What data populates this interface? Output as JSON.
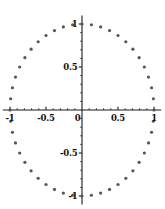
{
  "chart_data": {
    "type": "scatter",
    "title": "",
    "subtitle": "",
    "xlabel": "",
    "ylabel": "",
    "xlim": [
      -1.1,
      1.1
    ],
    "ylim": [
      -1.1,
      1.1
    ],
    "grid": false,
    "legend": null,
    "axes_style": "crossed-at-origin",
    "point_color": "#555555",
    "axis_color": "#1a1a1a",
    "point_size_px": 1.6,
    "n_points": 48,
    "radius": 1.0,
    "x_ticks": [
      -1,
      -0.5,
      0,
      0.5,
      1
    ],
    "x_tick_labels": [
      "-1",
      "-0.5",
      "0",
      "0.5",
      "1"
    ],
    "y_ticks": [
      -1,
      -0.5,
      0.5,
      1
    ],
    "y_tick_labels": [
      "-1",
      "-0.5",
      "0.5",
      "1"
    ],
    "minor_tick_step": 0.1,
    "points": [
      {
        "x": 1.0,
        "y": 0.0
      },
      {
        "x": 0.99144,
        "y": 0.13053
      },
      {
        "x": 0.96593,
        "y": 0.25882
      },
      {
        "x": 0.92388,
        "y": 0.38268
      },
      {
        "x": 0.86603,
        "y": 0.5
      },
      {
        "x": 0.79335,
        "y": 0.60876
      },
      {
        "x": 0.70711,
        "y": 0.70711
      },
      {
        "x": 0.60876,
        "y": 0.79335
      },
      {
        "x": 0.5,
        "y": 0.86603
      },
      {
        "x": 0.38268,
        "y": 0.92388
      },
      {
        "x": 0.25882,
        "y": 0.96593
      },
      {
        "x": 0.13053,
        "y": 0.99144
      },
      {
        "x": 0.0,
        "y": 1.0
      },
      {
        "x": -0.13053,
        "y": 0.99144
      },
      {
        "x": -0.25882,
        "y": 0.96593
      },
      {
        "x": -0.38268,
        "y": 0.92388
      },
      {
        "x": -0.5,
        "y": 0.86603
      },
      {
        "x": -0.60876,
        "y": 0.79335
      },
      {
        "x": -0.70711,
        "y": 0.70711
      },
      {
        "x": -0.79335,
        "y": 0.60876
      },
      {
        "x": -0.86603,
        "y": 0.5
      },
      {
        "x": -0.92388,
        "y": 0.38268
      },
      {
        "x": -0.96593,
        "y": 0.25882
      },
      {
        "x": -0.99144,
        "y": 0.13053
      },
      {
        "x": -1.0,
        "y": 0.0
      },
      {
        "x": -0.99144,
        "y": -0.13053
      },
      {
        "x": -0.96593,
        "y": -0.25882
      },
      {
        "x": -0.92388,
        "y": -0.38268
      },
      {
        "x": -0.86603,
        "y": -0.5
      },
      {
        "x": -0.79335,
        "y": -0.60876
      },
      {
        "x": -0.70711,
        "y": -0.70711
      },
      {
        "x": -0.60876,
        "y": -0.79335
      },
      {
        "x": -0.5,
        "y": -0.86603
      },
      {
        "x": -0.38268,
        "y": -0.92388
      },
      {
        "x": -0.25882,
        "y": -0.96593
      },
      {
        "x": -0.13053,
        "y": -0.99144
      },
      {
        "x": 0.0,
        "y": -1.0
      },
      {
        "x": 0.13053,
        "y": -0.99144
      },
      {
        "x": 0.25882,
        "y": -0.96593
      },
      {
        "x": 0.38268,
        "y": -0.92388
      },
      {
        "x": 0.5,
        "y": -0.86603
      },
      {
        "x": 0.60876,
        "y": -0.79335
      },
      {
        "x": 0.70711,
        "y": -0.70711
      },
      {
        "x": 0.79335,
        "y": -0.60876
      },
      {
        "x": 0.86603,
        "y": -0.5
      },
      {
        "x": 0.92388,
        "y": -0.38268
      },
      {
        "x": 0.96593,
        "y": -0.25882
      },
      {
        "x": 0.99144,
        "y": -0.13053
      }
    ]
  },
  "geometry": {
    "origin_x_px": 82,
    "origin_y_px": 110,
    "unit_x_px": 72,
    "unit_y_px": 86
  }
}
